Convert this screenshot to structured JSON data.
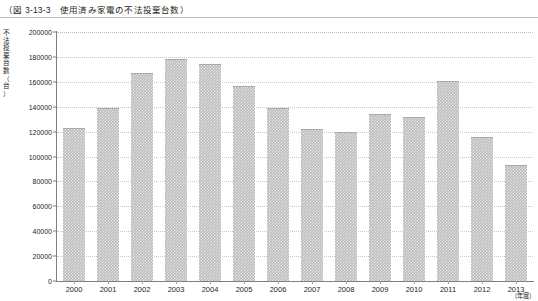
{
  "figure": {
    "title": "（図 3-13-3　使用済み家電の不法投棄台数）",
    "y_axis_label_chars": [
      "不",
      "法",
      "投",
      "棄",
      "台",
      "数",
      "（",
      "台",
      "）"
    ],
    "x_axis_unit": "（年度）"
  },
  "chart_data": {
    "type": "bar",
    "title": "（図 3-13-3　使用済み家電の不法投棄台数）",
    "xlabel": "（年度）",
    "ylabel": "不法投棄台数（台）",
    "categories": [
      "2000",
      "2001",
      "2002",
      "2003",
      "2004",
      "2005",
      "2006",
      "2007",
      "2008",
      "2009",
      "2010",
      "2011",
      "2012",
      "2013"
    ],
    "values": [
      123000,
      139000,
      167000,
      178000,
      174000,
      157000,
      139000,
      122000,
      120000,
      134000,
      132000,
      161000,
      116000,
      93000
    ],
    "ylim": [
      0,
      200000
    ],
    "yticks": [
      0,
      20000,
      40000,
      60000,
      80000,
      100000,
      120000,
      140000,
      160000,
      180000,
      200000
    ],
    "ytick_labels": [
      "0",
      "20000",
      "40000",
      "60000",
      "80000",
      "100000",
      "120000",
      "140000",
      "160000",
      "180000",
      "200000"
    ],
    "grid": true,
    "legend": null,
    "bar_color": "#bcbcbc"
  }
}
